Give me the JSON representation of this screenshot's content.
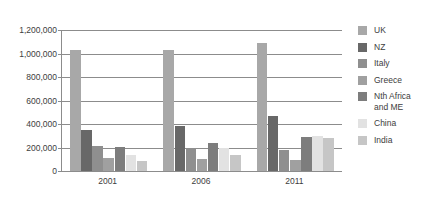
{
  "chart_data": {
    "type": "bar",
    "title": "",
    "subtitle": "",
    "xlabel": "",
    "ylabel": "",
    "categories": [
      "2001",
      "2006",
      "2011"
    ],
    "ylim": [
      0,
      1200000
    ],
    "ytick_values": [
      0,
      200000,
      400000,
      600000,
      800000,
      1000000,
      1200000
    ],
    "ytick_labels": [
      "0",
      "200,000",
      "400,000",
      "600,000",
      "800,000",
      "1,000,000",
      "1,200,000"
    ],
    "grid": true,
    "legend_position": "right",
    "series": [
      {
        "name": "UK",
        "color": "#a8a8a8",
        "values": [
          1030000,
          1028000,
          1090000
        ]
      },
      {
        "name": "NZ",
        "color": "#686868",
        "values": [
          350000,
          380000,
          472000
        ]
      },
      {
        "name": "Italy",
        "color": "#8f8f8f",
        "values": [
          215000,
          196000,
          175000
        ]
      },
      {
        "name": "Greece",
        "color": "#a0a0a0",
        "values": [
          110000,
          103000,
          90000
        ]
      },
      {
        "name": "Nth Africa\nand ME",
        "color": "#7d7d7d",
        "values": [
          208000,
          242000,
          292000
        ]
      },
      {
        "name": "China",
        "color": "#e2e2e2",
        "values": [
          135000,
          196000,
          300000
        ]
      },
      {
        "name": "India",
        "color": "#c6c6c6",
        "values": [
          88000,
          138000,
          282000
        ]
      }
    ]
  },
  "legend": {
    "items": [
      {
        "label": "UK"
      },
      {
        "label": "NZ"
      },
      {
        "label": "Italy"
      },
      {
        "label": "Greece"
      },
      {
        "label": "Nth Africa\nand ME"
      },
      {
        "label": "China"
      },
      {
        "label": "India"
      }
    ]
  },
  "axes": {
    "y_tick_labels": [
      "1,200,000",
      "1,000,000",
      "800,000",
      "600,000",
      "400,000",
      "200,000",
      "0"
    ],
    "x_tick_labels": [
      "2001",
      "2006",
      "2011"
    ]
  },
  "colors": {
    "axis": "#8c8c8c",
    "grid": "#8c8c8c",
    "text": "#3d3d3d",
    "background": "#ffffff"
  }
}
